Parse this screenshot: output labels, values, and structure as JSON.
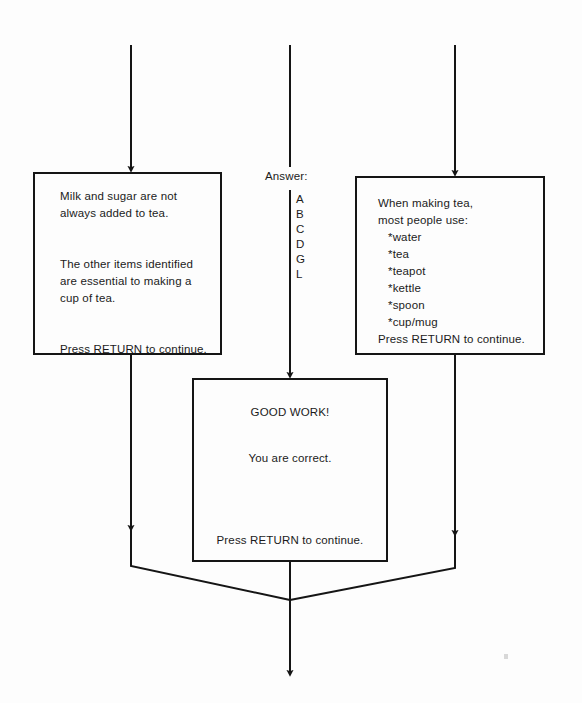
{
  "diagram": {
    "background_color": "#fdfdfd",
    "line_color": "#151515",
    "text_color": "#1b1b1b"
  },
  "left_box": {
    "lines": [
      "Milk and sugar are not",
      "always added to tea.",
      "",
      "",
      "The other items identified",
      "are essential to making a",
      "cup of tea.",
      "",
      "",
      "Press RETURN to continue."
    ],
    "text": "Milk and sugar are not\nalways added to tea.\n\n\nThe other items identified\nare essential to making a\ncup of tea.\n\n\nPress RETURN to continue."
  },
  "right_box": {
    "lines": [
      "When making tea,",
      "most people use:",
      "   *water",
      "   *tea",
      "   *teapot",
      "   *kettle",
      "   *spoon",
      "   *cup/mug",
      "Press RETURN to continue."
    ],
    "text": "When making tea,\nmost people use:\n   *water\n   *tea\n   *teapot\n   *kettle\n   *spoon\n   *cup/mug\nPress RETURN to continue."
  },
  "center_box": {
    "heading": "GOOD WORK!",
    "body": "You are correct.",
    "footer": "Press RETURN to continue."
  },
  "answer_column": {
    "label": "Answer:",
    "letters": [
      "A",
      "B",
      "C",
      "D",
      "G",
      "L"
    ]
  }
}
